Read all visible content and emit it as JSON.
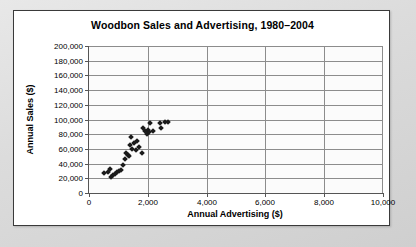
{
  "chart_data": {
    "type": "scatter",
    "title": "Woodbon Sales and Advertising, 1980–2004",
    "xlabel": "Annual Advertising ($)",
    "ylabel": "Annual Sales ($)",
    "xlim": [
      0,
      10000
    ],
    "ylim": [
      0,
      200000
    ],
    "xticks": [
      0,
      2000,
      4000,
      6000,
      8000,
      10000
    ],
    "xtick_labels": [
      "0",
      "2,000",
      "4,000",
      "6,000",
      "8,000",
      "10,000"
    ],
    "yticks": [
      0,
      20000,
      40000,
      60000,
      80000,
      100000,
      120000,
      140000,
      160000,
      180000,
      200000
    ],
    "ytick_labels": [
      "0",
      "20,000",
      "40,000",
      "60,000",
      "80,000",
      "100,000",
      "120,000",
      "140,000",
      "160,000",
      "180,000",
      "200,000"
    ],
    "grid": "horizontal-and-vertical",
    "legend": "none",
    "marker": "diamond",
    "marker_color": "#1a1a1a",
    "points": [
      {
        "x": 520,
        "y": 27000
      },
      {
        "x": 640,
        "y": 29000
      },
      {
        "x": 700,
        "y": 33000
      },
      {
        "x": 740,
        "y": 22000
      },
      {
        "x": 810,
        "y": 24000
      },
      {
        "x": 870,
        "y": 26000
      },
      {
        "x": 940,
        "y": 28000
      },
      {
        "x": 1010,
        "y": 30000
      },
      {
        "x": 1070,
        "y": 32000
      },
      {
        "x": 1140,
        "y": 38000
      },
      {
        "x": 1230,
        "y": 47000
      },
      {
        "x": 1270,
        "y": 55000
      },
      {
        "x": 1330,
        "y": 52000
      },
      {
        "x": 1370,
        "y": 51000
      },
      {
        "x": 1400,
        "y": 65000
      },
      {
        "x": 1440,
        "y": 76000
      },
      {
        "x": 1470,
        "y": 60000
      },
      {
        "x": 1530,
        "y": 68000
      },
      {
        "x": 1580,
        "y": 59000
      },
      {
        "x": 1640,
        "y": 71000
      },
      {
        "x": 1700,
        "y": 62000
      },
      {
        "x": 1790,
        "y": 54000
      },
      {
        "x": 1820,
        "y": 88000
      },
      {
        "x": 1900,
        "y": 84000
      },
      {
        "x": 1960,
        "y": 80000
      },
      {
        "x": 2000,
        "y": 86000
      },
      {
        "x": 2030,
        "y": 83000
      },
      {
        "x": 2090,
        "y": 95000
      },
      {
        "x": 2180,
        "y": 85000
      },
      {
        "x": 2400,
        "y": 95000
      },
      {
        "x": 2450,
        "y": 88000
      },
      {
        "x": 2600,
        "y": 96000
      },
      {
        "x": 2700,
        "y": 96000
      }
    ]
  }
}
